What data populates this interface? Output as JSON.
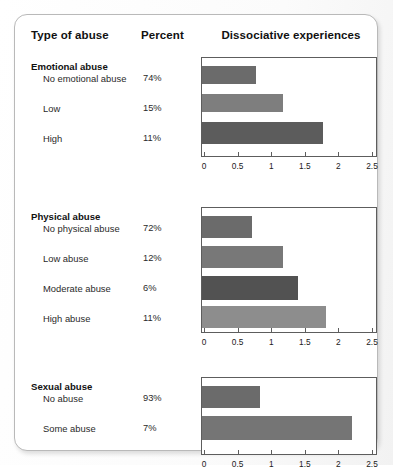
{
  "header": {
    "col_type": "Type of abuse",
    "col_percent": "Percent",
    "col_chart": "Dissociative experiences"
  },
  "chart_data": {
    "type": "bar",
    "orientation": "horizontal",
    "title": "Dissociative experiences",
    "xlabel": "",
    "ylabel": "Type of abuse",
    "xlim": [
      0,
      2.5
    ],
    "xticks": [
      0,
      0.5,
      1,
      1.5,
      2,
      2.5
    ],
    "xticklabels": [
      "0",
      "0.5",
      "1",
      "1.5",
      "2",
      "2.5"
    ],
    "grid": false,
    "legend": "none",
    "panels": [
      {
        "group": "Emotional abuse",
        "categories": [
          "No emotional abuse",
          "Low",
          "High"
        ],
        "percents": [
          "74%",
          "15%",
          "11%"
        ],
        "values": [
          0.77,
          1.18,
          1.77
        ],
        "colors": [
          "#6b6b6b",
          "#7e7e7e",
          "#5c5c5c"
        ]
      },
      {
        "group": "Physical abuse",
        "categories": [
          "No physical abuse",
          "Low abuse",
          "Moderate abuse",
          "High abuse"
        ],
        "percents": [
          "72%",
          "12%",
          "6%",
          "11%"
        ],
        "values": [
          0.72,
          1.18,
          1.4,
          1.82
        ],
        "colors": [
          "#6b6b6b",
          "#787878",
          "#525252",
          "#8d8d8d"
        ]
      },
      {
        "group": "Sexual abuse",
        "categories": [
          "No abuse",
          "Some abuse"
        ],
        "percents": [
          "93%",
          "7%"
        ],
        "values": [
          0.83,
          2.2
        ],
        "colors": [
          "#6b6b6b",
          "#757575"
        ]
      }
    ]
  },
  "layout": {
    "panel_tops": [
      42,
      192,
      362
    ],
    "panel_heights": [
      100,
      126,
      78
    ],
    "row_tops": [
      [
        58,
        88,
        118
      ],
      [
        208,
        238,
        268,
        298
      ],
      [
        378,
        408
      ]
    ],
    "group_title_tops": [
      46,
      196,
      366
    ],
    "sub_label_tops": [
      57,
      86,
      115,
      207,
      236,
      265,
      294,
      377,
      406
    ],
    "bar_geometry": [
      [
        {
          "top": 8,
          "h": 18
        },
        {
          "top": 36,
          "h": 18
        },
        {
          "top": 64,
          "h": 22
        }
      ],
      [
        {
          "top": 8,
          "h": 22
        },
        {
          "top": 38,
          "h": 22
        },
        {
          "top": 68,
          "h": 24
        },
        {
          "top": 98,
          "h": 22
        }
      ],
      [
        {
          "top": 8,
          "h": 22
        },
        {
          "top": 38,
          "h": 24
        }
      ]
    ]
  }
}
